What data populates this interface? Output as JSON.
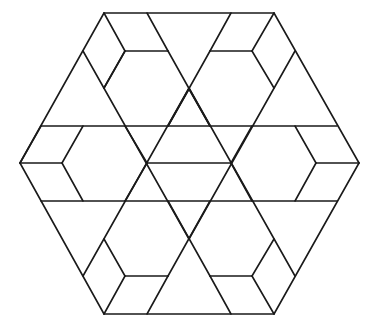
{
  "figure": {
    "stroke_color": "#1a1a1a",
    "background": "#ffffff",
    "stroke_width": 1.6,
    "segments": [
      [
        104,
        13,
        274,
        13
      ],
      [
        274,
        13,
        359,
        163
      ],
      [
        359,
        163,
        274,
        314
      ],
      [
        274,
        314,
        104,
        314
      ],
      [
        104,
        314,
        20,
        163
      ],
      [
        20,
        163,
        104,
        13
      ],
      [
        41,
        126,
        337,
        126
      ],
      [
        41,
        201,
        337,
        201
      ],
      [
        104,
        13,
        125,
        51
      ],
      [
        125,
        51,
        168,
        51
      ],
      [
        147,
        13,
        168,
        51
      ],
      [
        125,
        51,
        104,
        88
      ],
      [
        83,
        51,
        189,
        239
      ],
      [
        125,
        51,
        104,
        88
      ],
      [
        231,
        13,
        210,
        51
      ],
      [
        210,
        51,
        252,
        51
      ],
      [
        274,
        13,
        252,
        51
      ],
      [
        252,
        51,
        274,
        88
      ],
      [
        295,
        51,
        189,
        239
      ],
      [
        168,
        51,
        210,
        126
      ],
      [
        210,
        51,
        168,
        126
      ],
      [
        189,
        89,
        168,
        126
      ],
      [
        189,
        89,
        210,
        126
      ],
      [
        20,
        163,
        62,
        163
      ],
      [
        62,
        163,
        83,
        126
      ],
      [
        62,
        163,
        83,
        201
      ],
      [
        20,
        163,
        41,
        126
      ],
      [
        359,
        163,
        316,
        163
      ],
      [
        316,
        163,
        295,
        126
      ],
      [
        316,
        163,
        295,
        201
      ],
      [
        147,
        163,
        231,
        163
      ],
      [
        147,
        163,
        125,
        126
      ],
      [
        147,
        163,
        125,
        201
      ],
      [
        231,
        163,
        252,
        126
      ],
      [
        231,
        163,
        252,
        201
      ],
      [
        104,
        314,
        125,
        276
      ],
      [
        125,
        276,
        168,
        276
      ],
      [
        147,
        314,
        168,
        276
      ],
      [
        125,
        276,
        104,
        239
      ],
      [
        274,
        314,
        252,
        276
      ],
      [
        252,
        276,
        210,
        276
      ],
      [
        231,
        314,
        210,
        276
      ],
      [
        252,
        276,
        274,
        239
      ],
      [
        168,
        201,
        210,
        276
      ],
      [
        210,
        201,
        168,
        276
      ],
      [
        83,
        276,
        189,
        88
      ],
      [
        295,
        276,
        189,
        88
      ]
    ]
  }
}
